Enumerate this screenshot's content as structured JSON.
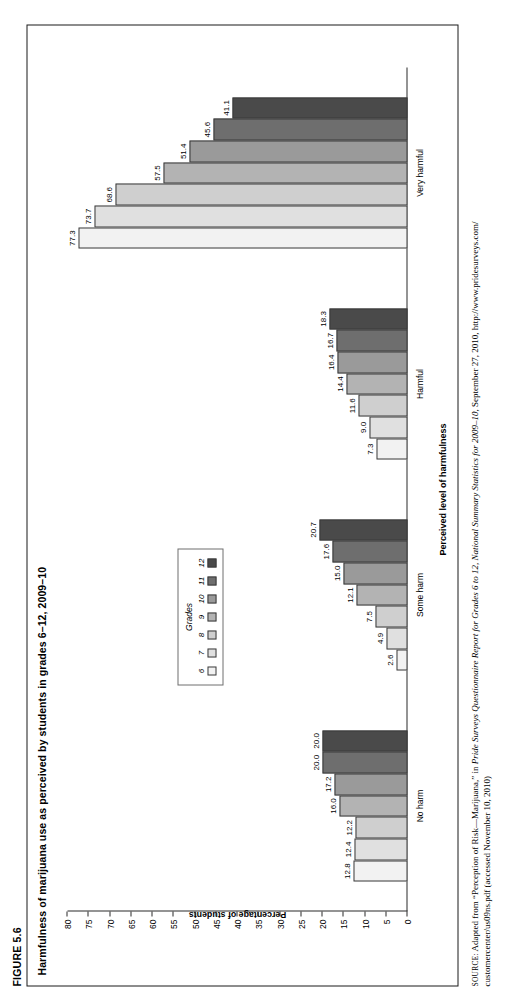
{
  "figure": {
    "label": "FIGURE 5.6",
    "title": "Harmfulness of marijuana use as perceived by students in grades 6–12, 2009–10"
  },
  "legend": {
    "title": "Grades",
    "items": [
      {
        "label": "6",
        "color": "#f2f2f2"
      },
      {
        "label": "7",
        "color": "#e0e0e0"
      },
      {
        "label": "8",
        "color": "#cfcfcf"
      },
      {
        "label": "9",
        "color": "#b3b3b3"
      },
      {
        "label": "10",
        "color": "#9a9a9a"
      },
      {
        "label": "11",
        "color": "#6e6e6e"
      },
      {
        "label": "12",
        "color": "#4a4a4a"
      }
    ]
  },
  "source": {
    "prefix": "SOURCE:",
    "line1_a": " Adapted from “Perception of Risk—Marijuana,” in ",
    "line1_italic": "Pride Surveys Questionnaire Report for Grades 6 to 12, National Summary Statistics for 2009–10",
    "line1_b": ", September 27, 2010, http://www.pridesurveys.com/",
    "line2": "customercenter/us09ns.pdf (accessed November 10, 2010)"
  },
  "chart_data": {
    "type": "bar",
    "title": "Harmfulness of marijuana use as perceived by students in grades 6–12, 2009–10",
    "xlabel": "Perceived level of harmfulness",
    "ylabel": "Percentage of students",
    "ylim": [
      0,
      80
    ],
    "ytick_step": 5,
    "yticks": [
      0,
      5,
      10,
      15,
      20,
      25,
      30,
      35,
      40,
      45,
      50,
      55,
      60,
      65,
      70,
      75,
      80
    ],
    "grid": false,
    "legend_position": "inside-upper-center",
    "categories": [
      "No harm",
      "Some harm",
      "Harmful",
      "Very harmful"
    ],
    "series": [
      {
        "name": "6",
        "color": "#f2f2f2",
        "values": [
          12.8,
          2.6,
          7.3,
          77.3
        ]
      },
      {
        "name": "7",
        "color": "#e0e0e0",
        "values": [
          12.4,
          4.9,
          9.0,
          73.7
        ]
      },
      {
        "name": "8",
        "color": "#cfcfcf",
        "values": [
          12.2,
          7.5,
          11.6,
          68.6
        ]
      },
      {
        "name": "9",
        "color": "#b3b3b3",
        "values": [
          16.0,
          12.1,
          14.4,
          57.5
        ]
      },
      {
        "name": "10",
        "color": "#9a9a9a",
        "values": [
          17.2,
          15.0,
          16.4,
          51.4
        ]
      },
      {
        "name": "11",
        "color": "#6e6e6e",
        "values": [
          20.0,
          17.6,
          16.7,
          45.6
        ]
      },
      {
        "name": "12",
        "color": "#4a4a4a",
        "values": [
          20.0,
          20.7,
          18.3,
          41.1
        ]
      }
    ],
    "data_labels": [
      [
        "12.8",
        "12.4",
        "12.2",
        "16.0",
        "17.2",
        "20.0",
        "20.0"
      ],
      [
        "2.6",
        "4.9",
        "7.5",
        "12.1",
        "15.0",
        "17.6",
        "20.7"
      ],
      [
        "7.3",
        "9.0",
        "11.6",
        "14.4",
        "16.4",
        "16.7",
        "18.3"
      ],
      [
        "77.3",
        "73.7",
        "68.6",
        "57.5",
        "51.4",
        "45.6",
        "41.1"
      ]
    ]
  }
}
